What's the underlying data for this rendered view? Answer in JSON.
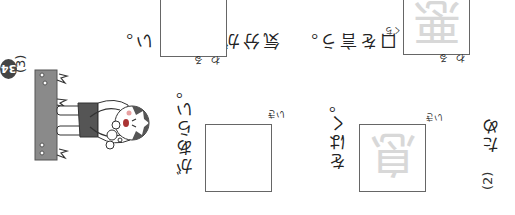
{
  "page_number": "34",
  "questions": [
    {
      "number": "(2)",
      "line1": {
        "before": "ため",
        "kanji": "息",
        "kanji_reading": "いき",
        "after": "をはく。"
      },
      "line2": {
        "before": "",
        "answer_box_reading": "いき",
        "after": "があらい。"
      }
    },
    {
      "number": "(3)",
      "line1": {
        "kanji": "悪",
        "kanji_reading": "わる",
        "after_kanji": "口",
        "after_kanji_reading": "くち",
        "after": "を言う。"
      },
      "line2": {
        "before": "気分が",
        "answer_box_reading": "わる",
        "after": "い。"
      }
    }
  ],
  "illustration": {
    "description": "boy panting with breath puffs",
    "colors": {
      "ground": "#8a8a8a",
      "hair": "#555555",
      "shorts": "#555555",
      "cheek": "#e8a0a0"
    }
  }
}
